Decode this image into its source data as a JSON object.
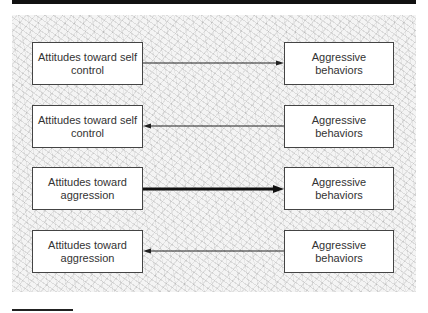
{
  "diagram": {
    "rows": [
      {
        "left": "Attitudes toward self control",
        "right": "Aggressive behaviors",
        "direction": "left-to-right",
        "weight": "thin"
      },
      {
        "left": "Attitudes toward self control",
        "right": "Aggressive behaviors",
        "direction": "right-to-left",
        "weight": "thin"
      },
      {
        "left": "Attitudes toward aggression",
        "right": "Aggressive behaviors",
        "direction": "left-to-right",
        "weight": "thick"
      },
      {
        "left": "Attitudes toward aggression",
        "right": "Aggressive behaviors",
        "direction": "right-to-left",
        "weight": "thin"
      }
    ]
  },
  "colors": {
    "line": "#222222",
    "box_border": "#444444",
    "topbar": "#111111"
  }
}
